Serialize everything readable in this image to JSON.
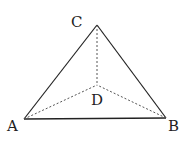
{
  "diagram": {
    "type": "tetrahedron",
    "vertices": {
      "A": {
        "label": "A",
        "x": 24,
        "y": 119
      },
      "B": {
        "label": "B",
        "x": 166,
        "y": 118
      },
      "C": {
        "label": "C",
        "x": 97,
        "y": 25
      },
      "D": {
        "label": "D",
        "x": 97,
        "y": 85
      }
    },
    "solid_edges": [
      "AB",
      "AC",
      "BC"
    ],
    "dashed_edges": [
      "AD",
      "BD",
      "CD"
    ],
    "colors": {
      "line": "#222222",
      "dashed": "#555555",
      "background": "#ffffff"
    }
  }
}
